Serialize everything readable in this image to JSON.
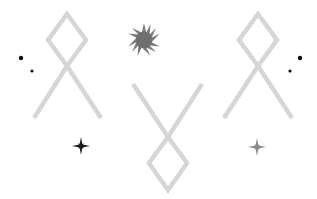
{
  "scene": {
    "background": "#ffffff",
    "rune_color": "#d6d6d6",
    "runes": [
      {
        "name": "othala-rune-left",
        "orientation": "upright"
      },
      {
        "name": "othala-rune-center",
        "orientation": "inverted"
      },
      {
        "name": "othala-rune-right",
        "orientation": "upright"
      }
    ],
    "sun": {
      "name": "sunburst-icon",
      "color": "#7a7a7a"
    },
    "sparkles": [
      {
        "name": "sparkle-icon-left",
        "color": "#1a1a1a"
      },
      {
        "name": "sparkle-icon-right",
        "color": "#8a8a8a"
      }
    ],
    "dots": [
      {
        "name": "dot-icon",
        "color": "#111111"
      }
    ]
  }
}
